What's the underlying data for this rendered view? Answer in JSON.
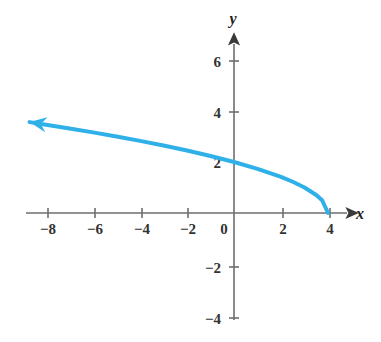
{
  "chart_data": {
    "type": "line",
    "title": "",
    "subtitle": "",
    "xlabel": "x",
    "ylabel": "y",
    "function": "y = sqrt(4 - x)",
    "xlim": [
      -9.0,
      5.0
    ],
    "ylim": [
      -4.6,
      7.0
    ],
    "grid": false,
    "legend": null,
    "axis_arrows": [
      "x-positive",
      "y-positive"
    ],
    "curve_arrow_end": "left",
    "xticks": [
      -8,
      -6,
      -4,
      -2,
      0,
      2,
      4
    ],
    "xtick_labels": [
      "−8",
      "−6",
      "−4",
      "−2",
      "0",
      "2",
      "4"
    ],
    "yticks": [
      -4,
      -2,
      2,
      4,
      6
    ],
    "ytick_labels": [
      "−4",
      "−2",
      "2",
      "4",
      "6"
    ],
    "curve_color": "#2fb0e8",
    "axis_color": "#6e6e6e",
    "label_color": "#333333",
    "series": [
      {
        "name": "y = sqrt(4 - x)",
        "x": [
          4.0,
          3.75,
          3.5,
          3.0,
          2.5,
          2.0,
          1.0,
          0.0,
          -1.0,
          -2.0,
          -3.0,
          -4.0,
          -5.0,
          -6.0,
          -7.0,
          -8.0,
          -8.7
        ],
        "values": [
          0.0,
          0.5,
          0.707,
          1.0,
          1.225,
          1.414,
          1.732,
          2.0,
          2.236,
          2.449,
          2.646,
          2.828,
          3.0,
          3.162,
          3.317,
          3.464,
          3.564
        ]
      }
    ],
    "annotations": [
      {
        "label": "x-intercept",
        "x": 4,
        "y": 0
      },
      {
        "label": "y-intercept",
        "x": 0,
        "y": 2
      }
    ]
  },
  "axes": {
    "x_axis_label": "x",
    "y_axis_label": "y"
  },
  "x_labels": [
    {
      "text": "−8",
      "value": -8
    },
    {
      "text": "−6",
      "value": -6
    },
    {
      "text": "−4",
      "value": -4
    },
    {
      "text": "−2",
      "value": -2
    },
    {
      "text": "0",
      "value": 0
    },
    {
      "text": "2",
      "value": 2
    },
    {
      "text": "4",
      "value": 4
    }
  ],
  "y_labels": [
    {
      "text": "6",
      "value": 6
    },
    {
      "text": "4",
      "value": 4
    },
    {
      "text": "2",
      "value": 2
    },
    {
      "text": "−2",
      "value": -2
    },
    {
      "text": "−4",
      "value": -4
    }
  ]
}
